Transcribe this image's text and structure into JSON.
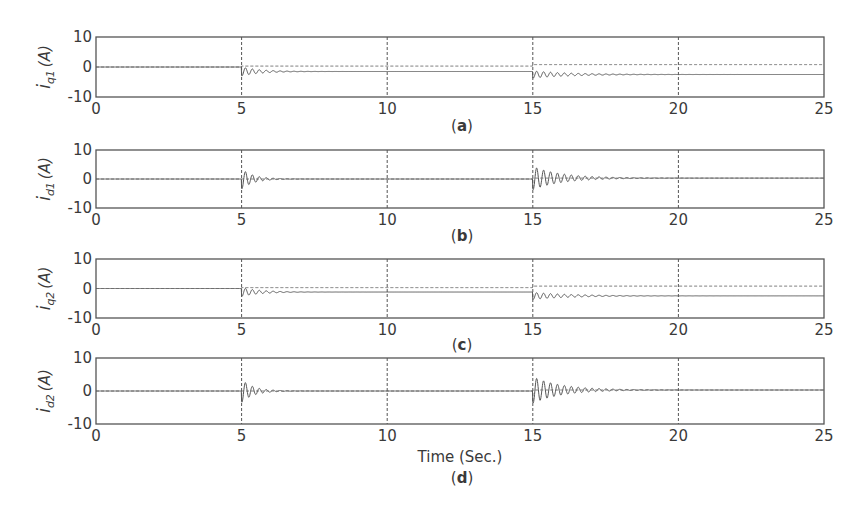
{
  "figure": {
    "xlabel": "Time (Sec.)",
    "colors": {
      "frame": "#555555",
      "actual": "#555555",
      "reference": "#666666",
      "grid": "#555555"
    }
  },
  "chart_data": [
    {
      "type": "line",
      "panel": "a",
      "caption": "a",
      "ylabel": {
        "symbol": "i",
        "subscript": "q1",
        "unit": "(A)"
      },
      "xlabel": "",
      "xlim": [
        0,
        25
      ],
      "ylim": [
        -10,
        10
      ],
      "xticks": [
        0,
        5,
        10,
        15,
        20,
        25
      ],
      "yticks": [
        10,
        0,
        -10
      ],
      "grid": "vertical dashed at x ticks",
      "series": [
        {
          "name": "actual",
          "style": "solid",
          "steps": [
            {
              "t": 0,
              "value": 0
            },
            {
              "t": 5,
              "value": -1.5
            },
            {
              "t": 15,
              "value": -2.5
            }
          ],
          "transients": [
            {
              "t": 5,
              "amplitude": 1.5,
              "decay": 0.7
            },
            {
              "t": 15,
              "amplitude": 1.2,
              "decay": 0.35
            }
          ]
        },
        {
          "name": "reference",
          "style": "dashed",
          "steps": [
            {
              "t": 0,
              "value": 0
            },
            {
              "t": 5,
              "value": 0.3
            },
            {
              "t": 15,
              "value": 0.8
            }
          ]
        }
      ]
    },
    {
      "type": "line",
      "panel": "b",
      "caption": "b",
      "ylabel": {
        "symbol": "i",
        "subscript": "d1",
        "unit": "(A)"
      },
      "xlabel": "",
      "xlim": [
        0,
        25
      ],
      "ylim": [
        -10,
        10
      ],
      "xticks": [
        0,
        5,
        10,
        15,
        20,
        25
      ],
      "yticks": [
        10,
        0,
        -10
      ],
      "grid": "vertical dashed at x ticks",
      "series": [
        {
          "name": "actual",
          "style": "solid",
          "steps": [
            {
              "t": 0,
              "value": 0
            },
            {
              "t": 5,
              "value": 0
            },
            {
              "t": 15,
              "value": 0.3
            }
          ],
          "transients": [
            {
              "t": 5,
              "amplitude": 3.5,
              "decay": 1.1
            },
            {
              "t": 15,
              "amplitude": 4.0,
              "decay": 0.45
            }
          ]
        },
        {
          "name": "reference",
          "style": "dashed",
          "steps": [
            {
              "t": 0,
              "value": 0
            },
            {
              "t": 15,
              "value": 0.3
            }
          ]
        }
      ]
    },
    {
      "type": "line",
      "panel": "c",
      "caption": "c",
      "ylabel": {
        "symbol": "i",
        "subscript": "q2",
        "unit": "(A)"
      },
      "xlabel": "",
      "xlim": [
        0,
        25
      ],
      "ylim": [
        -10,
        10
      ],
      "xticks": [
        0,
        5,
        10,
        15,
        20,
        25
      ],
      "yticks": [
        10,
        0,
        -10
      ],
      "grid": "vertical dashed at x ticks",
      "series": [
        {
          "name": "actual",
          "style": "solid",
          "steps": [
            {
              "t": 0,
              "value": 0
            },
            {
              "t": 5,
              "value": -1.2
            },
            {
              "t": 15,
              "value": -2.5
            }
          ],
          "transients": [
            {
              "t": 5,
              "amplitude": 1.5,
              "decay": 0.7
            },
            {
              "t": 15,
              "amplitude": 1.2,
              "decay": 0.35
            }
          ]
        },
        {
          "name": "reference",
          "style": "dashed",
          "steps": [
            {
              "t": 0,
              "value": 0
            },
            {
              "t": 5,
              "value": 0.3
            },
            {
              "t": 15,
              "value": 0.8
            }
          ]
        }
      ]
    },
    {
      "type": "line",
      "panel": "d",
      "caption": "d",
      "ylabel": {
        "symbol": "i",
        "subscript": "d2",
        "unit": "(A)"
      },
      "xlabel": "Time (Sec.)",
      "xlim": [
        0,
        25
      ],
      "ylim": [
        -10,
        10
      ],
      "xticks": [
        0,
        5,
        10,
        15,
        20,
        25
      ],
      "yticks": [
        10,
        0,
        -10
      ],
      "grid": "vertical dashed at x ticks",
      "series": [
        {
          "name": "actual",
          "style": "solid",
          "steps": [
            {
              "t": 0,
              "value": 0
            },
            {
              "t": 5,
              "value": 0
            },
            {
              "t": 15,
              "value": 0.3
            }
          ],
          "transients": [
            {
              "t": 5,
              "amplitude": 3.5,
              "decay": 1.1
            },
            {
              "t": 15,
              "amplitude": 4.0,
              "decay": 0.45
            }
          ]
        },
        {
          "name": "reference",
          "style": "dashed",
          "steps": [
            {
              "t": 0,
              "value": 0
            },
            {
              "t": 15,
              "value": 0.3
            }
          ]
        }
      ]
    }
  ],
  "layout": {
    "plot_left": 96,
    "plot_right": 824,
    "panels": [
      {
        "top": 37,
        "bottom": 97,
        "caption_y": 131,
        "caption_x": 462
      },
      {
        "top": 150,
        "bottom": 208,
        "caption_y": 241,
        "caption_x": 462
      },
      {
        "top": 259,
        "bottom": 318,
        "caption_y": 350,
        "caption_x": 462
      },
      {
        "top": 358,
        "bottom": 424,
        "caption_y": 483,
        "caption_x": 462
      }
    ],
    "xlabel_y": 462
  }
}
